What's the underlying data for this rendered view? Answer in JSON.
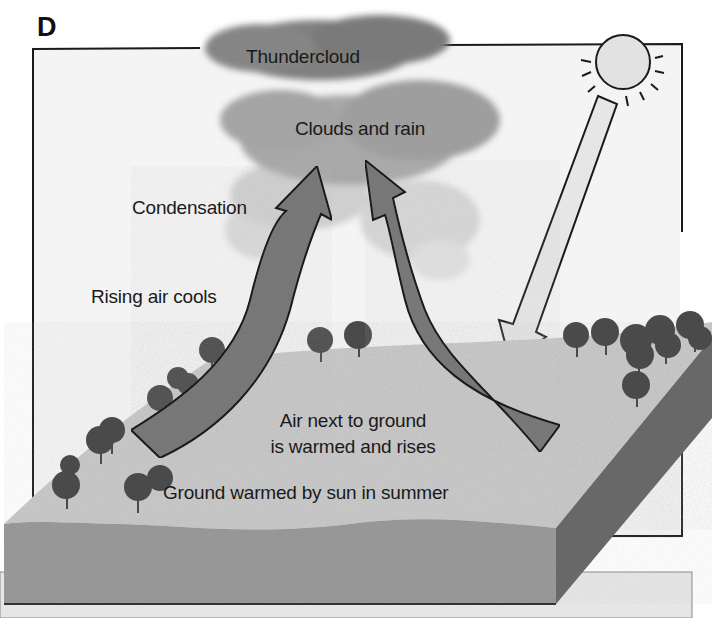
{
  "figure": {
    "panel_letter": "D"
  },
  "labels": {
    "thundercloud": "Thundercloud",
    "clouds_and_rain": "Clouds and rain",
    "condensation": "Condensation",
    "rising_air_cools": "Rising air cools",
    "air_next_to_ground_line1": "Air next to ground",
    "air_next_to_ground_line2": "is warmed and rises",
    "ground_warmed": "Ground warmed by sun in summer"
  },
  "elements": {
    "sun": "sun-icon",
    "sun_ray_arrow": "sunlight-arrow (pointing down-left to ground)",
    "rising_air_arrows": [
      "left-rising-arrow",
      "right-rising-arrow"
    ],
    "cloud": "thundercloud-shape",
    "landscape": "ground-block-with-trees"
  },
  "colors": {
    "sky_panel": "#f4f4f4",
    "frame_line": "#1a1a1a",
    "cloud_dark": "#8a8a8a",
    "cloud_light": "#b8b8b8",
    "arrow_fill": "#7a7a7a",
    "sun_fill": "#e2e2e2",
    "ground_top": "#c9c9c9",
    "ground_side": "#9a9a9a",
    "ground_right_side": "#6a6a6a",
    "tree": "#4a4a4a",
    "base_panel": "#e6e6e6"
  }
}
